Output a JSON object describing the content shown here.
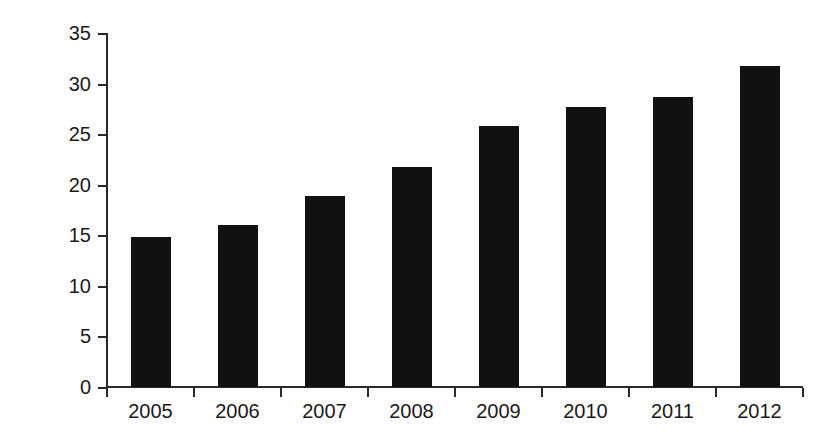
{
  "chart_data": {
    "type": "bar",
    "title": "",
    "subtitle": "",
    "xlabel": "",
    "ylabel": "Percentage",
    "categories": [
      "2005",
      "2006",
      "2007",
      "2008",
      "2009",
      "2010",
      "2011",
      "2012"
    ],
    "values": [
      14.8,
      16.0,
      18.9,
      21.8,
      25.8,
      27.7,
      28.7,
      31.7
    ],
    "series": [
      {
        "name": "Percentage",
        "values": [
          14.8,
          16.0,
          18.9,
          21.8,
          25.8,
          27.7,
          28.7,
          31.7
        ],
        "color": "#111111"
      }
    ],
    "ylim": [
      0,
      35
    ],
    "ytick_values": [
      0,
      5,
      10,
      15,
      20,
      25,
      30,
      35
    ],
    "ytick_labels": [
      "0",
      "5",
      "10",
      "15",
      "20",
      "25",
      "30",
      "35"
    ],
    "grid": false,
    "legend": false,
    "legend_position": "none",
    "bar_color": "#111111",
    "axis_color": "#2a2a2a",
    "background_color": "#ffffff"
  },
  "axis": {
    "y_title": "Percentage"
  }
}
